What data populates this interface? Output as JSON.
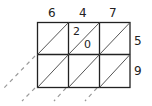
{
  "diagram": {
    "type": "lattice-multiplication",
    "top_digits": [
      "6",
      "4",
      "7"
    ],
    "right_digits": [
      "5",
      "9"
    ],
    "cell_entries": [
      {
        "row": 0,
        "col": 1,
        "tens": "2",
        "ones": "0"
      }
    ],
    "grid": {
      "rows": 2,
      "cols": 3
    },
    "colors": {
      "line": "#222222",
      "dashed": "#999999",
      "background": "#ffffff"
    }
  }
}
